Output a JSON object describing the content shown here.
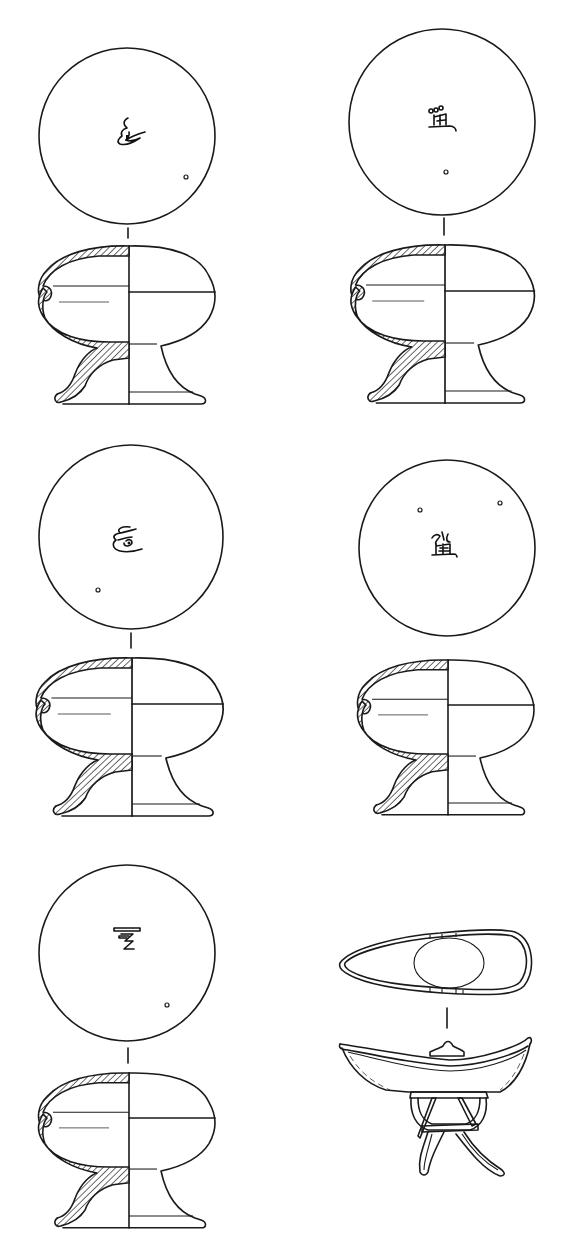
{
  "figure": {
    "type": "archaeological line drawing",
    "background_color": "#ffffff",
    "line_color": "#1a1a1a"
  },
  "panels": [
    {
      "id": "vessel-1",
      "position": "top-left",
      "plan_view": {
        "shape": "circle",
        "cx": 127,
        "cy": 136,
        "r": 88,
        "inscription_icon": "inscribed-mark-curl-icon",
        "small_holes": 1
      },
      "section_view": {
        "type": "half-section elevation",
        "hatched": true,
        "has_lid_line": true
      }
    },
    {
      "id": "vessel-2",
      "position": "top-right",
      "plan_view": {
        "shape": "circle",
        "cx": 442,
        "cy": 122,
        "r": 93,
        "inscription_icon": "inscribed-character-icon",
        "small_holes": 1
      },
      "section_view": {
        "type": "half-section elevation",
        "hatched": true,
        "has_lid_line": true
      }
    },
    {
      "id": "vessel-3",
      "position": "middle-left",
      "plan_view": {
        "shape": "circle",
        "cx": 131,
        "cy": 537,
        "r": 92,
        "inscription_icon": "inscribed-mark-curl-icon",
        "small_holes": 1
      },
      "section_view": {
        "type": "half-section elevation",
        "hatched": true,
        "has_lid_line": true
      }
    },
    {
      "id": "vessel-4",
      "position": "middle-right",
      "plan_view": {
        "shape": "circle",
        "cx": 447,
        "cy": 548,
        "r": 88,
        "inscription_icon": "inscribed-character-icon",
        "small_holes": 2
      },
      "section_view": {
        "type": "half-section elevation",
        "hatched": true,
        "has_lid_line": true
      }
    },
    {
      "id": "vessel-5",
      "position": "bottom-left",
      "plan_view": {
        "shape": "circle",
        "cx": 127,
        "cy": 953,
        "r": 88,
        "inscription_icon": "inscribed-mark-zigzag-icon",
        "small_holes": 1
      },
      "section_view": {
        "type": "half-section elevation",
        "hatched": true,
        "has_lid_line": true
      }
    },
    {
      "id": "ear-cup-on-stand",
      "position": "bottom-right",
      "plan_view": {
        "shape": "teardrop ear-cup with central oval"
      },
      "section_view": {
        "type": "elevation",
        "hatched": false,
        "has_tripod_stand": true
      }
    }
  ]
}
